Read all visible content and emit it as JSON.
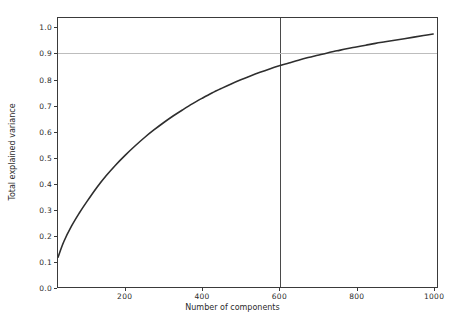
{
  "chart_data": {
    "type": "line",
    "title": "",
    "xlabel": "Number of components",
    "ylabel": "Total explained variance",
    "xlim": [
      25,
      1010
    ],
    "ylim": [
      0.0,
      1.04
    ],
    "grid": false,
    "legend": null,
    "x_ticks": [
      200,
      400,
      600,
      800,
      1000
    ],
    "x_tick_labels": [
      "200",
      "400",
      "600",
      "800",
      "1000"
    ],
    "y_ticks": [
      0.0,
      0.1,
      0.2,
      0.3,
      0.4,
      0.5,
      0.6,
      0.7,
      0.8,
      0.9,
      1.0
    ],
    "y_tick_labels": [
      "0.0",
      "0.1",
      "0.2",
      "0.3",
      "0.4",
      "0.5",
      "0.6",
      "0.7",
      "0.8",
      "0.9",
      "1.0"
    ],
    "series": [
      {
        "name": "cumulative explained variance",
        "color": "#2e2e2e",
        "linewidth": 1.6,
        "x": [
          25,
          40,
          60,
          80,
          100,
          125,
          150,
          175,
          200,
          225,
          250,
          275,
          300,
          325,
          350,
          375,
          400,
          425,
          450,
          475,
          500,
          525,
          550,
          575,
          600,
          625,
          650,
          675,
          700,
          725,
          750,
          775,
          800,
          825,
          850,
          875,
          900,
          925,
          950,
          975,
          1000
        ],
        "y": [
          0.115,
          0.175,
          0.235,
          0.285,
          0.33,
          0.383,
          0.43,
          0.472,
          0.51,
          0.545,
          0.578,
          0.608,
          0.636,
          0.662,
          0.686,
          0.709,
          0.73,
          0.75,
          0.768,
          0.785,
          0.801,
          0.816,
          0.83,
          0.843,
          0.855,
          0.866,
          0.877,
          0.887,
          0.896,
          0.905,
          0.913,
          0.921,
          0.928,
          0.935,
          0.942,
          0.948,
          0.954,
          0.96,
          0.966,
          0.972,
          0.978
        ]
      }
    ],
    "reference_lines": [
      {
        "name": "component-threshold-vline",
        "orientation": "vertical",
        "value": 600,
        "color": "#4a4a4a"
      },
      {
        "name": "variance-threshold-hline",
        "orientation": "horizontal",
        "value": 0.905,
        "color": "#bdbdbd"
      }
    ]
  }
}
